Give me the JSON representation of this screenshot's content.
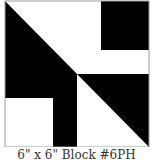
{
  "block": {
    "colors": {
      "dark": "#000000",
      "light": "#ffffff",
      "border": "#9a9a9a"
    },
    "caption": "6\" x 6\" Block #6PH"
  }
}
